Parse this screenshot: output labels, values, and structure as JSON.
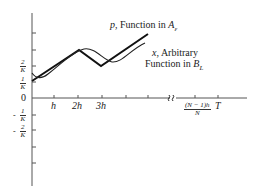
{
  "labels": {
    "p_curve": {
      "var": "p",
      "text": ", Function in ",
      "set": "A",
      "sub": "ε"
    },
    "x_curve_line1": {
      "var": "x",
      "text": ", Arbitrary"
    },
    "x_curve_line2": {
      "text": "Function in ",
      "set": "B",
      "sub": "L"
    }
  },
  "y_ticks": [
    {
      "sign": "",
      "num": "2",
      "den": "K"
    },
    {
      "sign": "",
      "num": "1",
      "den": "K"
    },
    {
      "zero": "0"
    },
    {
      "sign": "-",
      "num": "1",
      "den": "K"
    },
    {
      "sign": "-",
      "num": "2",
      "den": "K"
    }
  ],
  "x_ticks": [
    "h",
    "2h",
    "3h",
    "(N − 1)h",
    "N",
    "T"
  ],
  "colors": {
    "thick": "#111111",
    "thin": "#222222",
    "axis": "#555555"
  }
}
